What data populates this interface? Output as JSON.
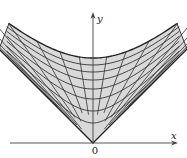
{
  "diagram": {
    "type": "hyperbolic-coordinate-grid",
    "axes": {
      "x_label": "x",
      "y_label": "y",
      "origin_label": "0"
    },
    "colors": {
      "fill": "#d9d9d9",
      "grid": "#333333",
      "boundary": "#222222",
      "axis": "#333333",
      "background": "#ffffff"
    },
    "geometry": {
      "origin_px": [
        93,
        143
      ],
      "scale_px": 1.0,
      "outer_radius": 85,
      "hyperbola_radii": [
        20,
        32,
        44,
        54,
        63,
        71,
        78,
        85
      ],
      "ray_rapidities": [
        -2.2,
        -1.8,
        -1.45,
        -1.15,
        -0.88,
        -0.62,
        -0.38,
        -0.16,
        0,
        0.16,
        0.38,
        0.62,
        0.88,
        1.15,
        1.45,
        1.8,
        2.2
      ],
      "cone_extent_px": 84,
      "x_axis_range_px": [
        10,
        178
      ],
      "y_axis_top_px": 12
    }
  }
}
